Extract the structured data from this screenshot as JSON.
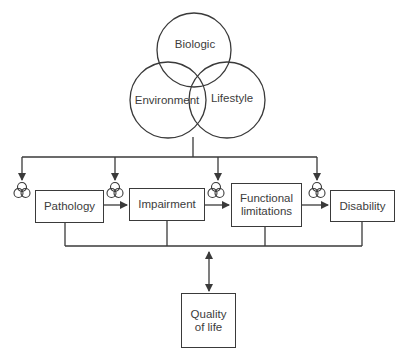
{
  "diagram": {
    "title": "",
    "circles": [
      {
        "id": "biologic",
        "label": "Biologic"
      },
      {
        "id": "environment",
        "label": "Environment"
      },
      {
        "id": "lifestyle",
        "label": "Lifestyle"
      }
    ],
    "boxes": [
      {
        "id": "pathology",
        "label": "Pathology"
      },
      {
        "id": "impairment",
        "label": "Impairment"
      },
      {
        "id": "functional-limitations",
        "label": "Functional limitations"
      },
      {
        "id": "disability",
        "label": "Disability"
      }
    ],
    "quality_of_life": {
      "label": "Quality of life"
    },
    "edges": [
      {
        "from": "factors",
        "to": "pathology",
        "type": "arrow"
      },
      {
        "from": "factors",
        "to": "impairment",
        "type": "arrow"
      },
      {
        "from": "factors",
        "to": "functional-limitations",
        "type": "arrow"
      },
      {
        "from": "factors",
        "to": "disability",
        "type": "arrow"
      },
      {
        "from": "pathology",
        "to": "impairment",
        "type": "arrow"
      },
      {
        "from": "impairment",
        "to": "functional-limitations",
        "type": "arrow"
      },
      {
        "from": "functional-limitations",
        "to": "disability",
        "type": "arrow"
      },
      {
        "from": "all-stages",
        "to": "quality-of-life",
        "type": "bidirectional"
      }
    ],
    "colors": {
      "stroke": "#3a3a3a",
      "background": "#ffffff"
    }
  }
}
